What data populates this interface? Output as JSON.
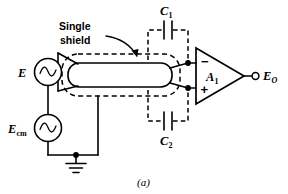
{
  "figure": {
    "label": "(a)",
    "callout": {
      "line1": "Single",
      "line2": "shield"
    }
  },
  "sources": {
    "signal": {
      "name": "E",
      "icon": "ac-source-icon"
    },
    "common_mode": {
      "name": "E",
      "subscript": "cm",
      "icon": "ac-source-icon"
    }
  },
  "capacitors": {
    "c1": {
      "name": "C",
      "subscript": "1"
    },
    "c2": {
      "name": "C",
      "subscript": "2"
    }
  },
  "amplifier": {
    "name": "A",
    "subscript": "1",
    "inverting_sign": "−",
    "noninverting_sign": "+"
  },
  "output": {
    "name": "E",
    "subscript": "O"
  },
  "ground": {
    "icon": "ground-icon"
  },
  "colors": {
    "line": "#000000",
    "background": "#ffffff"
  }
}
